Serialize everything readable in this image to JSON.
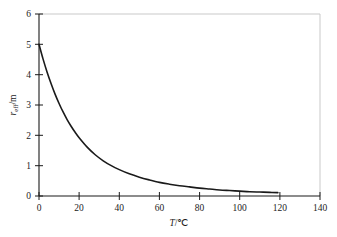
{
  "chart_data": {
    "type": "line",
    "title": "",
    "subtitle": "",
    "xlabel": "T/℃",
    "ylabel": "r_eff/m",
    "ylabel_parts": {
      "symbol": "r",
      "subscript": "eff",
      "unit": "/m"
    },
    "xlabel_parts": {
      "symbol": "T",
      "unit": "/℃"
    },
    "xlim": [
      0,
      140
    ],
    "ylim": [
      0,
      6
    ],
    "xticks": [
      0,
      20,
      40,
      60,
      80,
      100,
      120,
      140
    ],
    "xtick_labels": [
      "0",
      "20",
      "40",
      "60",
      "80",
      "100",
      "120",
      "140"
    ],
    "yticks": [
      0,
      1,
      2,
      3,
      4,
      5,
      6
    ],
    "ytick_labels": [
      "0",
      "1",
      "2",
      "3",
      "4",
      "5",
      "6"
    ],
    "grid": false,
    "legend": null,
    "legend_position": "none",
    "series": [
      {
        "name": "r_eff",
        "color": "#1a1a1a",
        "line_width": 1.6,
        "x": [
          0,
          2,
          4,
          6,
          8,
          10,
          12,
          14,
          16,
          18,
          20,
          24,
          28,
          32,
          36,
          40,
          45,
          50,
          55,
          60,
          65,
          70,
          75,
          80,
          85,
          90,
          95,
          100,
          105,
          110,
          115,
          119
        ],
        "y": [
          5.0,
          4.52,
          4.09,
          3.71,
          3.36,
          3.05,
          2.77,
          2.52,
          2.3,
          2.1,
          1.92,
          1.61,
          1.36,
          1.16,
          1.0,
          0.87,
          0.73,
          0.62,
          0.53,
          0.45,
          0.39,
          0.34,
          0.3,
          0.26,
          0.23,
          0.2,
          0.18,
          0.16,
          0.14,
          0.13,
          0.12,
          0.11
        ]
      }
    ],
    "annotations": []
  },
  "frame": {
    "axis_color": "#1a1a1a",
    "border_color": "#c9c9c9",
    "background": "#ffffff"
  }
}
